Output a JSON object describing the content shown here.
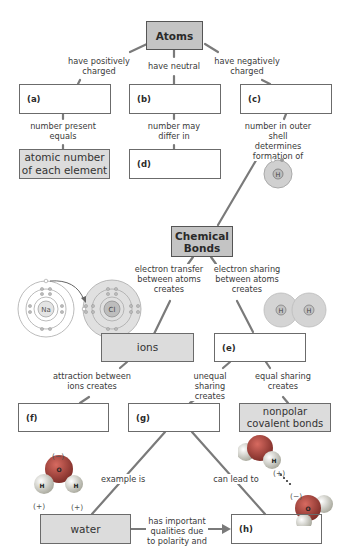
{
  "nodes": {
    "atoms": "Atoms",
    "a": "(a)",
    "b": "(b)",
    "c": "(c)",
    "atomic_number": "atomic number of each element",
    "d": "(d)",
    "chemical_bonds": "Chemical Bonds",
    "ions": "ions",
    "e": "(e)",
    "f": "(f)",
    "g": "(g)",
    "nonpolar": "nonpolar covalent bonds",
    "water": "water",
    "h": "(h)"
  },
  "links": {
    "pos_charged": "have positively charged",
    "neutral": "have neutral",
    "neg_charged": "have negatively charged",
    "number_present": "number present equals",
    "number_may_differ": "number may differ in",
    "outer_shell": "number in outer shell determines formation of",
    "electron_transfer": "electron transfer between atoms creates",
    "electron_sharing": "electron sharing between atoms creates",
    "attraction": "attraction between ions creates",
    "unequal": "unequal sharing creates",
    "equal": "equal sharing creates",
    "example_is": "example is",
    "can_lead_to": "can lead to",
    "important_qualities": "has important qualities due to polarity and"
  },
  "illustrations": {
    "h_atom": "H",
    "na_atom": "Na",
    "cl_atom": "Cl",
    "h2_left": "H",
    "h2_right": "H",
    "water_O": "O",
    "water_H1": "H",
    "water_H2": "H",
    "charge_minus": "(−)",
    "charge_plus_left": "(+)",
    "charge_plus_right": "(+)",
    "hb_H": "H",
    "hb_O": "O",
    "hb_plus": "(+)",
    "hb_minus": "(−)"
  },
  "colors": {
    "main_box": "#c4c4c4",
    "filled_box": "#dcdcdc",
    "connector": "#7a7a7a",
    "oxygen": "#b0433c",
    "hydrogen": "#e6e6dc"
  }
}
